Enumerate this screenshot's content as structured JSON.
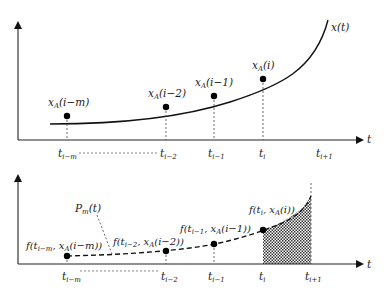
{
  "top_plot": {
    "axis_label_x": "t",
    "curve_label": "x(t)",
    "ticks": [
      {
        "base": "t",
        "sub": "i−m",
        "x": 58
      },
      {
        "base": "t",
        "sub": "i−2",
        "x": 160
      },
      {
        "base": "t",
        "sub": "i−1",
        "x": 208
      },
      {
        "base": "t",
        "sub": "i",
        "x": 259
      },
      {
        "base": "t",
        "sub": "i+1",
        "x": 316
      }
    ],
    "points": [
      {
        "label_base": "x",
        "label_sub": "A",
        "label_arg": "(i−m)",
        "cx": 67,
        "cy": 116
      },
      {
        "label_base": "x",
        "label_sub": "A",
        "label_arg": "(i−2)",
        "cx": 166,
        "cy": 107
      },
      {
        "label_base": "x",
        "label_sub": "A",
        "label_arg": "(i−1)",
        "cx": 214,
        "cy": 96
      },
      {
        "label_base": "x",
        "label_sub": "A",
        "label_arg": "(i)",
        "cx": 263,
        "cy": 79
      }
    ]
  },
  "bottom_plot": {
    "axis_label_x": "t",
    "interpolant_label_base": "P",
    "interpolant_label_sub": "m",
    "interpolant_label_arg": "(t)",
    "ticks": [
      {
        "base": "t",
        "sub": "i−m",
        "x": 67
      },
      {
        "base": "t",
        "sub": "i−2",
        "x": 166
      },
      {
        "base": "t",
        "sub": "i−1",
        "x": 214
      },
      {
        "base": "t",
        "sub": "i",
        "x": 263
      },
      {
        "base": "t",
        "sub": "i+1",
        "x": 311
      }
    ],
    "points": [
      {
        "label": "f(t",
        "sub1": "i−m",
        "mid": ", x",
        "sub2": "A",
        "tail": "(i−m))",
        "cx": 67,
        "cy": 256
      },
      {
        "label": "f(t",
        "sub1": "i−2",
        "mid": ", x",
        "sub2": "A",
        "tail": "(i−2))",
        "cx": 166,
        "cy": 251
      },
      {
        "label": "f(t",
        "sub1": "i−1",
        "mid": ", x",
        "sub2": "A",
        "tail": "(i−1))",
        "cx": 214,
        "cy": 244
      },
      {
        "label": "f(t",
        "sub1": "i",
        "mid": ", x",
        "sub2": "A",
        "tail": "(i))",
        "cx": 263,
        "cy": 230
      }
    ],
    "shaded_region": {
      "from": "t_i",
      "to": "t_i+1",
      "pattern": "crosshatch"
    }
  },
  "colors": {
    "ink": "#111111",
    "background": "#ffffff",
    "hatch": "#333333"
  }
}
